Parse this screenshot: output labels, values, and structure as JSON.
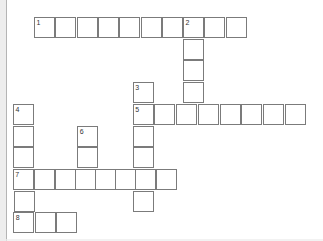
{
  "puzzle": {
    "kind": "crossword-grid",
    "state": "empty",
    "words": [
      {
        "number": "1",
        "direction": "across",
        "length": 10
      },
      {
        "number": "2",
        "direction": "down",
        "length": 5
      },
      {
        "number": "3",
        "direction": "down",
        "length": 6
      },
      {
        "number": "4",
        "direction": "down",
        "length": 6
      },
      {
        "number": "5",
        "direction": "across",
        "length": 8
      },
      {
        "number": "6",
        "direction": "down",
        "length": 3
      },
      {
        "number": "7",
        "direction": "across",
        "length": 8
      },
      {
        "number": "8",
        "direction": "across",
        "length": 3
      }
    ],
    "cells": [
      {
        "x": 34,
        "y": 17,
        "n": "1"
      },
      {
        "x": 55.3,
        "y": 17
      },
      {
        "x": 76.6,
        "y": 17
      },
      {
        "x": 97.9,
        "y": 17
      },
      {
        "x": 119.2,
        "y": 17
      },
      {
        "x": 140.5,
        "y": 17
      },
      {
        "x": 161.8,
        "y": 17
      },
      {
        "x": 183.1,
        "y": 17,
        "n": "2"
      },
      {
        "x": 204.4,
        "y": 17
      },
      {
        "x": 225.7,
        "y": 17
      },
      {
        "x": 183.1,
        "y": 38.7
      },
      {
        "x": 183.1,
        "y": 60.4
      },
      {
        "x": 183.1,
        "y": 82.1
      },
      {
        "x": 132.7,
        "y": 82.1,
        "n": "3"
      },
      {
        "x": 132.7,
        "y": 125.5
      },
      {
        "x": 132.7,
        "y": 147.2
      },
      {
        "x": 133.3,
        "y": 190.6
      },
      {
        "x": 13,
        "y": 103.8,
        "n": "4"
      },
      {
        "x": 13,
        "y": 125.5
      },
      {
        "x": 13,
        "y": 147.2
      },
      {
        "x": 14,
        "y": 190.6
      },
      {
        "x": 132.7,
        "y": 103.8,
        "n": "5"
      },
      {
        "x": 154.4,
        "y": 103.8
      },
      {
        "x": 176.1,
        "y": 103.8
      },
      {
        "x": 197.8,
        "y": 103.8
      },
      {
        "x": 219.5,
        "y": 103.8
      },
      {
        "x": 241.2,
        "y": 103.8
      },
      {
        "x": 262.9,
        "y": 103.8
      },
      {
        "x": 284.6,
        "y": 103.8
      },
      {
        "x": 77.3,
        "y": 125.5,
        "n": "6"
      },
      {
        "x": 77.3,
        "y": 147.2
      },
      {
        "x": 12.7,
        "y": 168.9,
        "n": "7"
      },
      {
        "x": 34,
        "y": 168.9
      },
      {
        "x": 55,
        "y": 168.9
      },
      {
        "x": 74.7,
        "y": 168.9
      },
      {
        "x": 95.3,
        "y": 168.9
      },
      {
        "x": 115.3,
        "y": 168.9
      },
      {
        "x": 134.7,
        "y": 168.9
      },
      {
        "x": 156.3,
        "y": 168.9
      },
      {
        "x": 13.3,
        "y": 212.3,
        "n": "8"
      },
      {
        "x": 35,
        "y": 212.3
      },
      {
        "x": 56.3,
        "y": 212.3
      }
    ]
  },
  "colors": {
    "page_bg": "#ffffff",
    "cell_bg": "#ffffff",
    "cell_border": "#7b7b7b",
    "number": "#333333",
    "left_strip_bg": "#ededed",
    "left_strip_line": "#b4b4b4"
  }
}
